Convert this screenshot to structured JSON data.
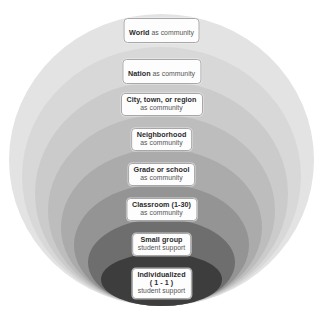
{
  "diagram": {
    "type": "concentric-spheres",
    "background_color": "#ffffff",
    "levels": [
      {
        "id": "world",
        "order": 1,
        "primary": "World",
        "secondary": "as community",
        "inline": true,
        "ring_color": "#e3e3e3"
      },
      {
        "id": "nation",
        "order": 2,
        "primary": "Nation",
        "secondary": "as community",
        "inline": true,
        "ring_color": "#d8d8d8"
      },
      {
        "id": "city-town-region",
        "order": 3,
        "primary": "City, town, or region",
        "secondary": "as community",
        "inline": false,
        "ring_color": "#cbcbcb"
      },
      {
        "id": "neighborhood",
        "order": 4,
        "primary": "Neighborhood",
        "secondary": "as community",
        "inline": false,
        "ring_color": "#bdbdbd"
      },
      {
        "id": "grade-or-school",
        "order": 5,
        "primary": "Grade or school",
        "secondary": "as community",
        "inline": false,
        "ring_color": "#ababab"
      },
      {
        "id": "classroom",
        "order": 6,
        "primary": "Classroom (1-30)",
        "secondary": "as community",
        "inline": false,
        "ring_color": "#949494"
      },
      {
        "id": "small-group",
        "order": 7,
        "primary": "Small group",
        "secondary": "student support",
        "inline": false,
        "ring_color": "#6e6e6e"
      },
      {
        "id": "individualized",
        "order": 8,
        "primary": "Individualized",
        "primary_second_line": "( 1 - 1 )",
        "secondary": "student support",
        "inline": false,
        "ring_color": "#3d3d3d"
      }
    ]
  }
}
